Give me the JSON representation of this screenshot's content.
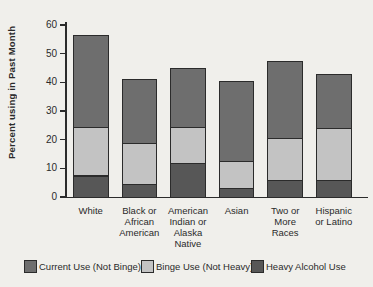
{
  "figure": {
    "background_color": "#f0efeb",
    "text_color": "#2a2a2a",
    "axis_color": "#2b2b2b"
  },
  "chart_data": {
    "type": "bar",
    "stacked": true,
    "title": "",
    "xlabel": "",
    "ylabel": "Percent using in Past Month",
    "ylim": [
      0,
      60
    ],
    "y_ticks": [
      0,
      10,
      20,
      30,
      40,
      50,
      60
    ],
    "grid": false,
    "categories": [
      "White",
      "Black or African American",
      "American Indian or Alaska Native",
      "Asian",
      "Two or More Races",
      "Hispanic or Latino"
    ],
    "category_label_lines": [
      [
        "White"
      ],
      [
        "Black or",
        "African",
        "American"
      ],
      [
        "American",
        "Indian or",
        "Alaska",
        "Native"
      ],
      [
        "Asian"
      ],
      [
        "Two or",
        "More",
        "Races"
      ],
      [
        "Hispanic",
        "or Latino"
      ]
    ],
    "stack_order_bottom_to_top": [
      "Heavy Alcohol Use",
      "Binge Use (Not Heavy)",
      "Current Use (Not Binge)"
    ],
    "series": [
      {
        "name": "Heavy Alcohol Use",
        "color": "#575757",
        "values": [
          7.5,
          4.5,
          12.0,
          3.0,
          6.0,
          6.0
        ]
      },
      {
        "name": "Binge Use (Not Heavy)",
        "color": "#c3c3c3",
        "values": [
          17.0,
          14.5,
          12.5,
          9.5,
          14.5,
          18.0
        ]
      },
      {
        "name": "Current Use (Not Binge)",
        "color": "#6e6e6e",
        "values": [
          32.0,
          22.3,
          20.5,
          28.0,
          26.8,
          19.0
        ]
      }
    ],
    "bar_totals": [
      56.5,
      41.3,
      45.0,
      40.5,
      47.3,
      43.0
    ],
    "legend": {
      "position": "bottom",
      "items": [
        {
          "label": "Current Use (Not Binge)",
          "color": "#6e6e6e"
        },
        {
          "label": "Binge Use (Not Heavy)",
          "color": "#c3c3c3"
        },
        {
          "label": "Heavy Alcohol Use",
          "color": "#575757"
        }
      ]
    }
  }
}
